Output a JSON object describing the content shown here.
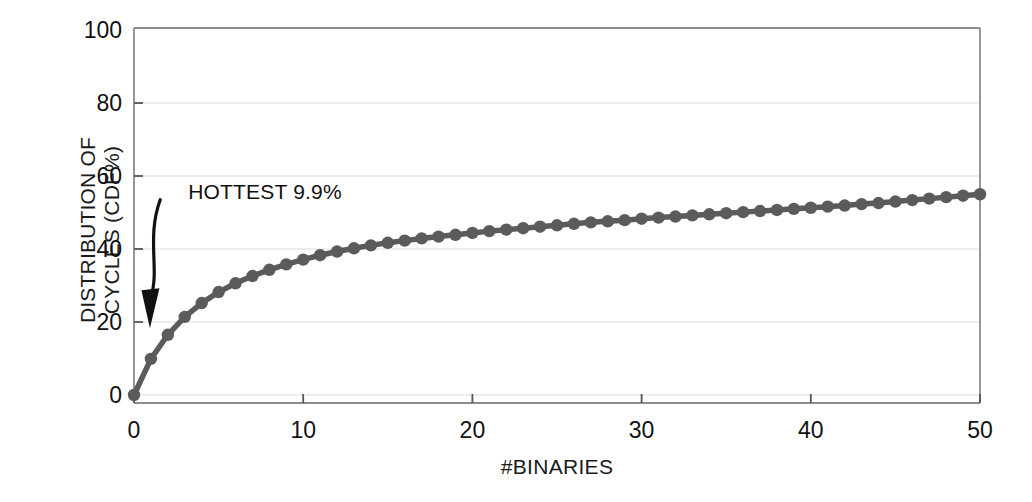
{
  "chart_data": {
    "type": "line",
    "title": "",
    "xlabel": "#BINARIES",
    "ylabel": "DISTRIBUTION OF\nCYCLES (CDF%)",
    "xlim": [
      0,
      50
    ],
    "ylim": [
      0,
      100
    ],
    "xticks": [
      0,
      10,
      20,
      30,
      40,
      50
    ],
    "yticks": [
      0,
      20,
      40,
      60,
      80,
      100
    ],
    "xtick_labels": [
      "0",
      "10",
      "20",
      "30",
      "40",
      "50"
    ],
    "ytick_labels": [
      "0",
      "20",
      "40",
      "60",
      "80",
      "100"
    ],
    "grid": "horizontal",
    "legend": "none",
    "marker": "circle",
    "series_color": "#5b5b5b",
    "grid_color": "#e8e8ea",
    "axis_color": "#8c8c8c",
    "x": [
      0,
      1,
      2,
      3,
      4,
      5,
      6,
      7,
      8,
      9,
      10,
      11,
      12,
      13,
      14,
      15,
      16,
      17,
      18,
      19,
      20,
      21,
      22,
      23,
      24,
      25,
      26,
      27,
      28,
      29,
      30,
      31,
      32,
      33,
      34,
      35,
      36,
      37,
      38,
      39,
      40,
      41,
      42,
      43,
      44,
      45,
      46,
      47,
      48,
      49,
      50
    ],
    "y": [
      0.0,
      9.9,
      16.5,
      21.4,
      25.2,
      28.2,
      30.6,
      32.6,
      34.3,
      35.8,
      37.1,
      38.3,
      39.3,
      40.2,
      41.0,
      41.7,
      42.3,
      42.9,
      43.4,
      43.9,
      44.4,
      44.9,
      45.3,
      45.7,
      46.1,
      46.5,
      46.9,
      47.3,
      47.6,
      47.9,
      48.3,
      48.6,
      48.9,
      49.2,
      49.5,
      49.8,
      50.1,
      50.4,
      50.7,
      51.0,
      51.3,
      51.6,
      51.9,
      52.3,
      52.6,
      53.0,
      53.4,
      53.8,
      54.2,
      54.6,
      55.0
    ],
    "annotations": [
      {
        "text": "HOTTEST 9.9%",
        "text_x": 3.2,
        "text_y": 55.0,
        "arrow_from_x": 1.55,
        "arrow_from_y": 53.5,
        "arrow_to_x": 1.0,
        "arrow_to_y": 21.0
      }
    ]
  }
}
